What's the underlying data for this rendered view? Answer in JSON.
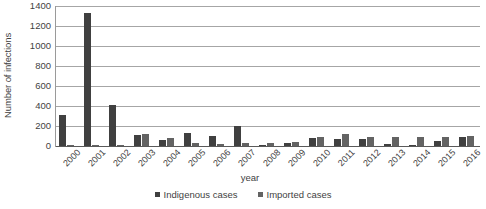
{
  "chart_data": {
    "type": "bar",
    "title": "",
    "xlabel": "year",
    "ylabel": "Number of infections",
    "categories": [
      "2000",
      "2001",
      "2002",
      "2003",
      "2004",
      "2005",
      "2006",
      "2007",
      "2008",
      "2009",
      "2010",
      "2011",
      "2012",
      "2013",
      "2014",
      "2015",
      "2016"
    ],
    "series": [
      {
        "name": "Indigenous cases",
        "color": "#404040",
        "values": [
          310,
          1330,
          415,
          110,
          60,
          135,
          100,
          200,
          15,
          30,
          85,
          75,
          70,
          20,
          15,
          50,
          95
        ]
      },
      {
        "name": "Imported cases",
        "color": "#636363",
        "values": [
          10,
          15,
          10,
          125,
          85,
          30,
          25,
          35,
          35,
          45,
          95,
          120,
          95,
          90,
          95,
          90,
          100
        ]
      }
    ],
    "ylim": [
      0,
      1400
    ],
    "yticks": [
      0,
      200,
      400,
      600,
      800,
      1000,
      1200,
      1400
    ],
    "ytick_labels": [
      "0",
      "200",
      "400",
      "600",
      "800",
      "1000",
      "1200",
      "1400"
    ],
    "grid": true,
    "grid_axis": "y",
    "legend_position": "bottom"
  },
  "legend": {
    "items": [
      {
        "label": "Indigenous cases",
        "color": "#404040"
      },
      {
        "label": "Imported cases",
        "color": "#636363"
      }
    ]
  }
}
